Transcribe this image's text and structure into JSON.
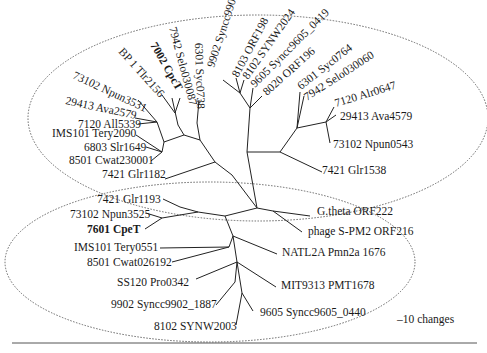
{
  "figure": {
    "type": "unrooted phylogenetic tree",
    "scale_label": "–10 changes",
    "colors": {
      "branch": "#222222",
      "text": "#1a1a1a",
      "ellipse": "#666666"
    }
  },
  "groups": [
    {
      "name": "upper-clade",
      "cx": 258,
      "cy": 118,
      "rx": 230,
      "ry": 103
    },
    {
      "name": "lower-clade",
      "cx": 210,
      "cy": 262,
      "rx": 205,
      "ry": 80
    }
  ],
  "nodes": {
    "root": [
      257,
      208
    ],
    "u0": [
      232,
      175
    ],
    "u1": [
      215,
      162
    ],
    "u2": [
      200,
      140
    ],
    "u3": [
      197,
      123
    ],
    "u4": [
      184,
      135
    ],
    "u5": [
      178,
      125
    ],
    "u6": [
      175,
      113
    ],
    "u7": [
      164,
      142
    ],
    "u8": [
      157,
      122
    ],
    "u9": [
      162,
      152
    ],
    "ua": [
      247,
      152
    ],
    "ub": [
      250,
      108
    ],
    "uc": [
      240,
      93
    ],
    "ud": [
      280,
      152
    ],
    "ue": [
      297,
      128
    ],
    "uf": [
      326,
      122
    ],
    "l0": [
      225,
      216
    ],
    "l1": [
      198,
      212
    ],
    "l2": [
      180,
      207
    ],
    "l3": [
      162,
      218
    ],
    "l4": [
      233,
      236
    ],
    "l5": [
      229,
      247
    ],
    "l6": [
      237,
      262
    ],
    "l7": [
      235,
      282
    ],
    "l8": [
      242,
      293
    ],
    "g0": [
      273,
      211
    ]
  },
  "edges": [
    [
      "root",
      "u0"
    ],
    [
      "u0",
      "u1"
    ],
    [
      "u1",
      "u2"
    ],
    [
      "u2",
      "u3"
    ],
    [
      "u2",
      "u4"
    ],
    [
      "u4",
      "u5"
    ],
    [
      "u4",
      "u7"
    ],
    [
      "u7",
      "u8"
    ],
    [
      "u7",
      "u9"
    ],
    [
      "root",
      "ua"
    ],
    [
      "ua",
      "ub"
    ],
    [
      "ub",
      "uc"
    ],
    [
      "ua",
      "ud"
    ],
    [
      "ud",
      "ue"
    ],
    [
      "ue",
      "uf"
    ],
    [
      "root",
      "l0"
    ],
    [
      "l0",
      "l1"
    ],
    [
      "l1",
      "l2"
    ],
    [
      "l1",
      "l3"
    ],
    [
      "l0",
      "l4"
    ],
    [
      "l4",
      "l5"
    ],
    [
      "l4",
      "l6"
    ],
    [
      "l6",
      "l7"
    ],
    [
      "l6",
      "l8"
    ],
    [
      "root",
      "g0"
    ]
  ],
  "leaves": [
    {
      "label": "73102 Npun3531",
      "node": "u8",
      "tip": [
        138,
        100
      ],
      "tx": 72,
      "ty": 78,
      "rot": 25,
      "bold": false
    },
    {
      "label": "BP 1 Tlr2156",
      "node": "u6",
      "tip": [
        162,
        95
      ],
      "tx": 118,
      "ty": 52,
      "rot": 48,
      "bold": false
    },
    {
      "label": "7002 CpcT",
      "node": "u5",
      "tip": [
        172,
        98
      ],
      "tx": 150,
      "ty": 45,
      "rot": 60,
      "bold": true
    },
    {
      "label": "7942 Selo030087",
      "node": "u6",
      "tip": [
        180,
        98
      ],
      "tx": 169,
      "ty": 28,
      "rot": 75,
      "bold": false
    },
    {
      "label": "6301 Syc0738",
      "node": "u3",
      "tip": [
        199,
        100
      ],
      "tx": 195,
      "ty": 43,
      "rot": 88,
      "bold": false
    },
    {
      "label": "9902 Syncc9902_1910",
      "node": "uc",
      "tip": [
        223,
        80
      ],
      "tx": 214,
      "ty": 68,
      "rot": -72,
      "bold": false
    },
    {
      "label": "8103 ORF198",
      "node": "uc",
      "tip": [
        236,
        78
      ],
      "tx": 238,
      "ty": 78,
      "rot": -62,
      "bold": false
    },
    {
      "label": "8102 SYNW2024",
      "node": "uc",
      "tip": [
        244,
        80
      ],
      "tx": 248,
      "ty": 80,
      "rot": -55,
      "bold": false
    },
    {
      "label": "9605 Syncc9605_0419",
      "node": "ub",
      "tip": [
        253,
        88
      ],
      "tx": 255,
      "ty": 88,
      "rot": -45,
      "bold": false
    },
    {
      "label": "8020 ORF196",
      "node": "ub",
      "tip": [
        262,
        96
      ],
      "tx": 267,
      "ty": 96,
      "rot": -42,
      "bold": false
    },
    {
      "label": "6301 Syc0764",
      "node": "ue",
      "tip": [
        300,
        92
      ],
      "tx": 301,
      "ty": 90,
      "rot": -38,
      "bold": false
    },
    {
      "label": "7942 Selo030060",
      "node": "ue",
      "tip": [
        304,
        96
      ],
      "tx": 307,
      "ty": 101,
      "rot": -33,
      "bold": false
    },
    {
      "label": "7120 Alr0647",
      "node": "uf",
      "tip": [
        334,
        107
      ],
      "tx": 336,
      "ty": 107,
      "rot": -17,
      "bold": false
    },
    {
      "label": "29413 Ava4579",
      "node": "uf",
      "tip": [
        336,
        115
      ],
      "tx": 340,
      "ty": 120,
      "rot": 0,
      "bold": false
    },
    {
      "label": "73102 Npun0543",
      "node": "uf",
      "tip": [
        330,
        143
      ],
      "tx": 333,
      "ty": 148,
      "rot": 0,
      "bold": false
    },
    {
      "label": "7421 Glr1538",
      "node": "ud",
      "tip": [
        322,
        172
      ],
      "tx": 322,
      "ty": 174,
      "rot": 0,
      "bold": false
    },
    {
      "label": "29413 Ava2579",
      "node": "u8",
      "tip": [
        135,
        118
      ],
      "tx": 65,
      "ty": 104,
      "rot": 12,
      "bold": false
    },
    {
      "label": "7120 All5339",
      "node": "u8",
      "tip": [
        138,
        124
      ],
      "tx": 78,
      "ty": 128,
      "rot": 0,
      "bold": false
    },
    {
      "label": "IMS101 Tery2090",
      "node": "u9",
      "tip": [
        136,
        135
      ],
      "tx": 52,
      "ty": 137,
      "rot": 0,
      "bold": false
    },
    {
      "label": "6803 Slr1649",
      "node": "u9",
      "tip": [
        146,
        147
      ],
      "tx": 84,
      "ty": 151,
      "rot": 0,
      "bold": false
    },
    {
      "label": "8501 Cwat230001",
      "node": "u9",
      "tip": [
        151,
        161
      ],
      "tx": 69,
      "ty": 164,
      "rot": 0,
      "bold": false
    },
    {
      "label": "7421 Glr1182",
      "node": "u1",
      "tip": [
        165,
        179
      ],
      "tx": 102,
      "ty": 178,
      "rot": 0,
      "bold": false
    },
    {
      "label": "7421 Glr1193",
      "node": "l2",
      "tip": [
        163,
        199
      ],
      "tx": 97,
      "ty": 203,
      "rot": 0,
      "bold": false
    },
    {
      "label": "73102 Npun3525",
      "node": "l3",
      "tip": [
        146,
        213
      ],
      "tx": 70,
      "ty": 218,
      "rot": 0,
      "bold": false
    },
    {
      "label": "7601 CpeT",
      "node": "l3",
      "tip": [
        145,
        229
      ],
      "tx": 87,
      "ty": 233,
      "rot": 0,
      "bold": true
    },
    {
      "label": "IMS101 Tery0551",
      "node": "l5",
      "tip": [
        160,
        248
      ],
      "tx": 74,
      "ty": 251,
      "rot": 0,
      "bold": false
    },
    {
      "label": "8501 Cwat026192",
      "node": "l5",
      "tip": [
        172,
        262
      ],
      "tx": 87,
      "ty": 266,
      "rot": 0,
      "bold": false
    },
    {
      "label": "SS120 Pro0342",
      "node": "l6",
      "tip": [
        196,
        279
      ],
      "tx": 117,
      "ty": 286,
      "rot": 0,
      "bold": false
    },
    {
      "label": "9902 Syncc9902_1887",
      "node": "l7",
      "tip": [
        216,
        305
      ],
      "tx": 111,
      "ty": 308,
      "rot": 0,
      "bold": false
    },
    {
      "label": "8102 SYNW2003",
      "node": "l8",
      "tip": [
        236,
        325
      ],
      "tx": 154,
      "ty": 330,
      "rot": 0,
      "bold": false
    },
    {
      "label": "9605 Syncc9605_0440",
      "node": "l8",
      "tip": [
        253,
        311
      ],
      "tx": 260,
      "ty": 316,
      "rot": 0,
      "bold": false
    },
    {
      "label": "MIT9313 PMT1678",
      "node": "l6",
      "tip": [
        276,
        287
      ],
      "tx": 281,
      "ty": 289,
      "rot": 0,
      "bold": false
    },
    {
      "label": "NATL2A Pmn2a 1676",
      "node": "l4",
      "tip": [
        277,
        254
      ],
      "tx": 282,
      "ty": 256,
      "rot": 0,
      "bold": false
    },
    {
      "label": "G.theta ORF222",
      "node": "g0",
      "tip": [
        310,
        216
      ],
      "tx": 317,
      "ty": 215,
      "rot": 0,
      "bold": false
    },
    {
      "label": "phage S-PM2 ORF216",
      "node": "g0",
      "tip": [
        302,
        232
      ],
      "tx": 308,
      "ty": 235,
      "rot": 0,
      "bold": false
    }
  ],
  "scale_bar": {
    "x1": 392,
    "x2": 397,
    "y": 319,
    "label_x": 397,
    "label_y": 323
  },
  "bottom_rule": {
    "x1": 12,
    "x2": 477,
    "y": 343
  }
}
